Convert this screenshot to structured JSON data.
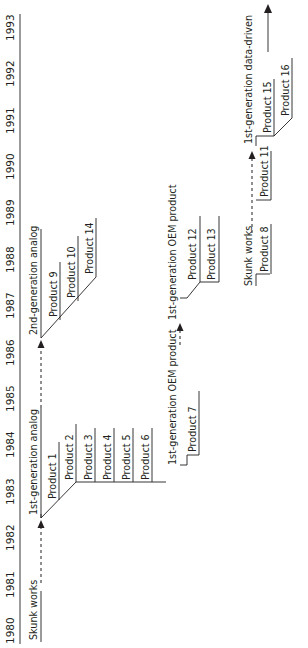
{
  "timeline": {
    "axis": {
      "years": [
        "1980",
        "1981",
        "1982",
        "1983",
        "1984",
        "1985",
        "1986",
        "1987",
        "1988",
        "1989",
        "1990",
        "1991",
        "1992",
        "1993"
      ]
    },
    "tracks": {
      "analog": {
        "skunk_works": "Skunk works",
        "gen1": {
          "label": "1st-generation analog",
          "products": [
            "Product 1",
            "Product 2",
            "Product 3",
            "Product 4",
            "Product 5",
            "Product 6"
          ]
        },
        "gen2": {
          "label": "2nd-generation analog",
          "products": [
            "Product 9",
            "Product 10",
            "Product 14"
          ]
        }
      },
      "oem": {
        "gen1_a": {
          "label": "1st-generation OEM product",
          "products": [
            "Product 7"
          ]
        },
        "gen1_b": {
          "label": "1st-generation OEM product",
          "products": [
            "Product 12",
            "Product 13"
          ]
        }
      },
      "data_driven": {
        "skunk_works": {
          "label": "Skunk works",
          "products": [
            "Product 8",
            "Product 11"
          ]
        },
        "gen1": {
          "label": "1st-generation data-driven",
          "products": [
            "Product 15",
            "Product 16"
          ]
        }
      }
    }
  },
  "colors": {
    "ink": "#231f20",
    "background": "#ffffff"
  }
}
